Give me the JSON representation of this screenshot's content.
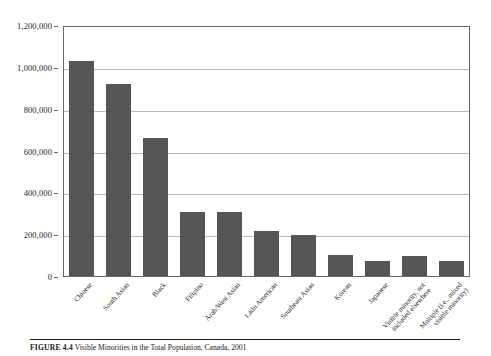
{
  "caption": {
    "label": "FIGURE 4.4",
    "title": "Visible Minorities in the Total Population, Canada, 2001"
  },
  "chart_data": {
    "type": "bar",
    "title": "Visible Minorities in the Total Population, Canada, 2001",
    "xlabel": "",
    "ylabel": "",
    "ylim": [
      0,
      1200000
    ],
    "grid": true,
    "legend": false,
    "bar_color": "#555555",
    "yticks": [
      0,
      200000,
      400000,
      600000,
      800000,
      1000000,
      1200000
    ],
    "ytick_labels": [
      "0",
      "200,000",
      "400,000",
      "600,000",
      "800,000",
      "1,000,000",
      "1,200,000"
    ],
    "categories": [
      "Chinese",
      "South Asian",
      "Black",
      "Filipino",
      "Arab/West Asian",
      "Latin American",
      "Southeast Asian",
      "Korean",
      "Japanese",
      "Visible minority, not included elsewhere",
      "Multiple (i.e., mixed visible minority)"
    ],
    "values": [
      1029000,
      917000,
      662000,
      308000,
      304000,
      216000,
      198000,
      101000,
      74000,
      98000,
      73000
    ]
  }
}
